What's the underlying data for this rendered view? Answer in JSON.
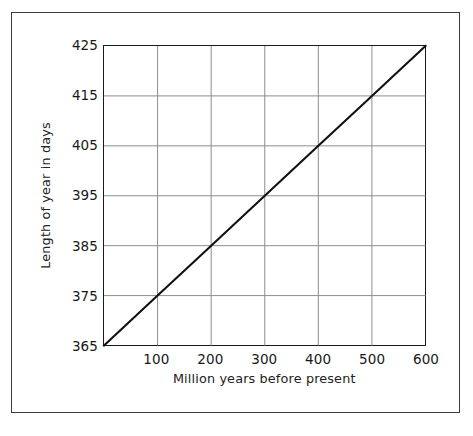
{
  "figure": {
    "frame_color": "#3b3b3b",
    "background": "#ffffff"
  },
  "chart_data": {
    "type": "line",
    "title": "",
    "subtitle": "",
    "xlabel": "Million years before present",
    "ylabel": "Length of year in days",
    "xlim": [
      0,
      600
    ],
    "ylim": [
      365,
      425
    ],
    "grid": true,
    "legend": null,
    "legend_position": "none",
    "x_ticks": [
      0,
      100,
      200,
      300,
      400,
      500,
      600
    ],
    "x_tick_labels": [
      "",
      "100",
      "200",
      "300",
      "400",
      "500",
      "600"
    ],
    "y_ticks": [
      365,
      375,
      385,
      395,
      405,
      415,
      425
    ],
    "y_tick_labels": [
      "365",
      "375",
      "385",
      "395",
      "405",
      "415",
      "425"
    ],
    "line_color": "#111111",
    "grid_color": "#8c8c8c",
    "axis_color": "#1a1a1a",
    "series": [
      {
        "name": "Length of year",
        "x": [
          0,
          100,
          200,
          300,
          400,
          500,
          600
        ],
        "values": [
          365,
          375,
          385,
          395,
          405,
          415,
          425
        ]
      }
    ],
    "annotations": []
  }
}
